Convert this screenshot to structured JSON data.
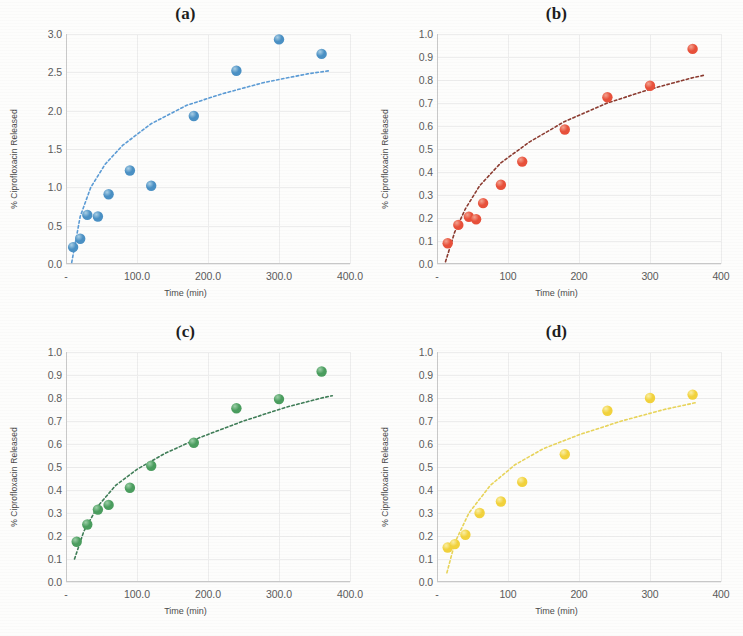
{
  "figure": {
    "background": "#fdfdfc",
    "panel_count": 4
  },
  "chart_data": [
    {
      "type": "scatter",
      "panel": "(a)",
      "title": "(a)",
      "xlabel": "Time (min)",
      "ylabel": "% Ciprofloxacin Released",
      "marker_color": "#4a90c4",
      "marker_highlight": "#a9cfe6",
      "trend_color": "#5b9bd5",
      "xlim": [
        0,
        400
      ],
      "ylim": [
        0,
        3.0
      ],
      "xticks": [
        0,
        100,
        200,
        300,
        400
      ],
      "xticklabels": [
        "-",
        "100.0",
        "200.0",
        "300.0",
        "400.0"
      ],
      "yticks": [
        0,
        0.5,
        1.0,
        1.5,
        2.0,
        2.5,
        3.0
      ],
      "yticklabels": [
        "0.0",
        "0.5",
        "1.0",
        "1.5",
        "2.0",
        "2.5",
        "3.0"
      ],
      "grid": true,
      "legend": "none",
      "x": [
        10,
        20,
        30,
        45,
        60,
        90,
        120,
        180,
        240,
        300,
        360
      ],
      "y": [
        0.22,
        0.33,
        0.64,
        0.62,
        0.91,
        1.22,
        1.02,
        1.93,
        2.52,
        2.93,
        2.74
      ],
      "trend": {
        "form": "logarithmic",
        "points_x": [
          8,
          20,
          35,
          55,
          80,
          120,
          170,
          220,
          280,
          340,
          370
        ],
        "points_y": [
          0.02,
          0.62,
          1.0,
          1.3,
          1.55,
          1.83,
          2.07,
          2.22,
          2.37,
          2.48,
          2.52
        ]
      }
    },
    {
      "type": "scatter",
      "panel": "(b)",
      "title": "(b)",
      "xlabel": "Time (min)",
      "ylabel": "% Ciprofloxacin Released",
      "marker_color": "#e8503a",
      "marker_highlight": "#f4a28f",
      "trend_color": "#8b3a2f",
      "xlim": [
        0,
        400
      ],
      "ylim": [
        0,
        1.0
      ],
      "xticks": [
        0,
        100,
        200,
        300,
        400
      ],
      "xticklabels": [
        "-",
        "100",
        "200",
        "300",
        "400"
      ],
      "yticks": [
        0,
        0.1,
        0.2,
        0.3,
        0.4,
        0.5,
        0.6,
        0.7,
        0.8,
        0.9,
        1.0
      ],
      "yticklabels": [
        "0.0",
        "0.1",
        "0.2",
        "0.3",
        "0.4",
        "0.5",
        "0.6",
        "0.7",
        "0.8",
        "0.9",
        "1.0"
      ],
      "grid": true,
      "legend": "none",
      "x": [
        15,
        30,
        45,
        55,
        65,
        90,
        120,
        180,
        240,
        300,
        360
      ],
      "y": [
        0.09,
        0.17,
        0.205,
        0.195,
        0.265,
        0.345,
        0.445,
        0.585,
        0.725,
        0.775,
        0.935
      ],
      "trend": {
        "form": "logarithmic",
        "points_x": [
          12,
          25,
          40,
          60,
          90,
          130,
          180,
          240,
          300,
          360,
          375
        ],
        "points_y": [
          0.01,
          0.14,
          0.24,
          0.34,
          0.44,
          0.53,
          0.62,
          0.7,
          0.76,
          0.81,
          0.82
        ]
      }
    },
    {
      "type": "scatter",
      "panel": "(c)",
      "title": "(c)",
      "xlabel": "Time (min)",
      "ylabel": "% Ciprofloxacin Released",
      "marker_color": "#4a9d5e",
      "marker_highlight": "#9ccfa7",
      "trend_color": "#3f7d57",
      "xlim": [
        0,
        400
      ],
      "ylim": [
        0,
        1.0
      ],
      "xticks": [
        0,
        100,
        200,
        300,
        400
      ],
      "xticklabels": [
        "-",
        "100.0",
        "200.0",
        "300.0",
        "400.0"
      ],
      "yticks": [
        0,
        0.1,
        0.2,
        0.3,
        0.4,
        0.5,
        0.6,
        0.7,
        0.8,
        0.9,
        1.0
      ],
      "yticklabels": [
        "0.0",
        "0.1",
        "0.2",
        "0.3",
        "0.4",
        "0.5",
        "0.6",
        "0.7",
        "0.8",
        "0.9",
        "1.0"
      ],
      "grid": true,
      "legend": "none",
      "x": [
        15,
        30,
        45,
        60,
        90,
        120,
        180,
        240,
        300,
        360
      ],
      "y": [
        0.175,
        0.25,
        0.315,
        0.335,
        0.41,
        0.505,
        0.605,
        0.755,
        0.795,
        0.915
      ],
      "trend": {
        "form": "logarithmic",
        "points_x": [
          12,
          25,
          45,
          70,
          100,
          140,
          190,
          250,
          310,
          360,
          375
        ],
        "points_y": [
          0.1,
          0.22,
          0.33,
          0.42,
          0.49,
          0.56,
          0.63,
          0.7,
          0.76,
          0.8,
          0.81
        ]
      }
    },
    {
      "type": "scatter",
      "panel": "(d)",
      "title": "(d)",
      "xlabel": "Time (min)",
      "ylabel": "% Ciprofloxacin Released",
      "marker_color": "#f2d23c",
      "marker_highlight": "#fbf0a6",
      "trend_color": "#e8d45a",
      "xlim": [
        0,
        400
      ],
      "ylim": [
        0,
        1.0
      ],
      "xticks": [
        0,
        100,
        200,
        300,
        400
      ],
      "xticklabels": [
        "-",
        "100",
        "200",
        "300",
        "400"
      ],
      "yticks": [
        0,
        0.1,
        0.2,
        0.3,
        0.4,
        0.5,
        0.6,
        0.7,
        0.8,
        0.9,
        1.0
      ],
      "yticklabels": [
        "0.0",
        "0.1",
        "0.2",
        "0.3",
        "0.4",
        "0.5",
        "0.6",
        "0.7",
        "0.8",
        "0.9",
        "1.0"
      ],
      "grid": true,
      "legend": "none",
      "x": [
        15,
        25,
        40,
        60,
        90,
        120,
        180,
        240,
        300,
        360
      ],
      "y": [
        0.15,
        0.165,
        0.205,
        0.3,
        0.35,
        0.435,
        0.555,
        0.745,
        0.8,
        0.815
      ],
      "trend": {
        "form": "logarithmic",
        "points_x": [
          14,
          25,
          45,
          75,
          110,
          150,
          200,
          260,
          320,
          365
        ],
        "points_y": [
          0.04,
          0.17,
          0.3,
          0.42,
          0.51,
          0.58,
          0.64,
          0.7,
          0.75,
          0.78
        ]
      }
    }
  ]
}
